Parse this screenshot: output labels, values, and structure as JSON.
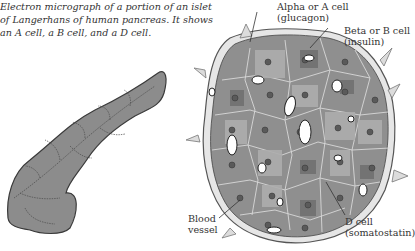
{
  "caption": {
    "lines": [
      "Electron micrograph of a portion of an islet",
      "of Langerhans of human pancreas. It shows",
      "an A cell, a B cell, and a D cell."
    ]
  },
  "figures": {
    "pancreas": {
      "name": "Pancreas",
      "fill": "#8a8a8a"
    },
    "islet": {
      "name": "Islet of Langerhans",
      "fill": "#8c8c8c"
    }
  },
  "labels": {
    "alpha": {
      "line1": "Alpha or A cell",
      "line2": "(glucagon)"
    },
    "beta": {
      "line1": "Beta or B cell",
      "line2": "(insulin)"
    },
    "blood_vessel": {
      "line1": "Blood",
      "line2": "vessel"
    },
    "delta": {
      "line1": "D cell",
      "line2": "(somatostatin)"
    }
  }
}
